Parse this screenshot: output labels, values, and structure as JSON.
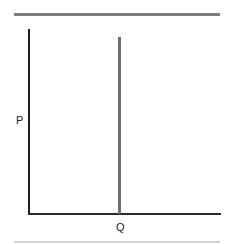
{
  "diagram": {
    "type": "supply-demand-graph",
    "y_axis_label": "P",
    "x_axis_label": "Q",
    "curves": [
      {
        "name": "vertical supply line",
        "orientation": "vertical",
        "color": "#6e6e6e"
      }
    ]
  },
  "colors": {
    "top_rule": "#7d7d7d",
    "bottom_rule": "#d2d2d2",
    "axes": "#1e1e1e",
    "curve": "#6e6e6e"
  }
}
